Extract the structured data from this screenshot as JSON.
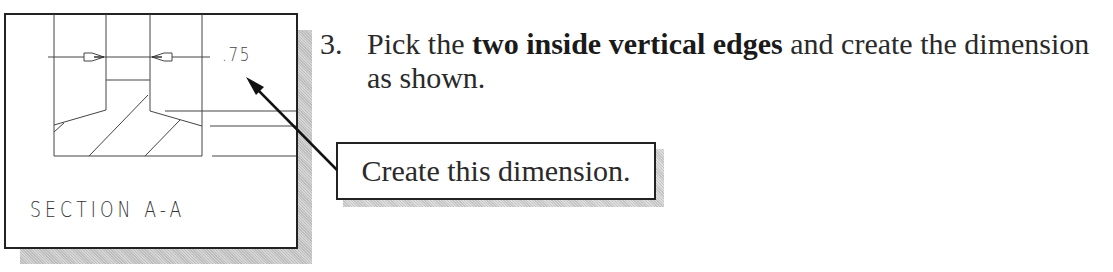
{
  "figure": {
    "section_label": "SECTION  A-A",
    "dimension_value": ".75"
  },
  "instruction": {
    "step_number": "3.",
    "text_before": "Pick the ",
    "text_bold": "two inside vertical edges",
    "text_after": " and create the dimension as shown."
  },
  "callout": {
    "text": "Create this dimension."
  },
  "colors": {
    "line": "#222222",
    "text": "#2a2a2a",
    "shadow": "#c8c8c8"
  }
}
